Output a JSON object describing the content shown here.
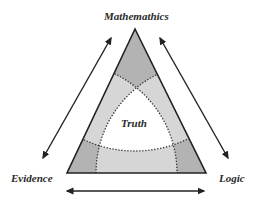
{
  "diagram": {
    "type": "triangle-venn",
    "labels": {
      "top": "Mathemathics",
      "left": "Evidence",
      "right": "Logic",
      "center": "Truth"
    },
    "arrows": [
      {
        "from": "Mathemathics",
        "to": "Evidence",
        "bidirectional": true
      },
      {
        "from": "Mathemathics",
        "to": "Logic",
        "bidirectional": true
      },
      {
        "from": "Evidence",
        "to": "Logic",
        "bidirectional": true
      }
    ],
    "colors": {
      "outline": "#222222",
      "corner_fill": "#b3b3b3",
      "band_fill": "#d6d6d6",
      "center_fill": "#ffffff",
      "text": "#2a2a2a"
    }
  }
}
